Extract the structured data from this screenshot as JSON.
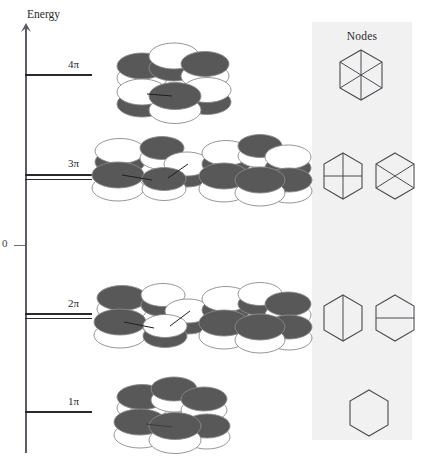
{
  "figure": {
    "axis": {
      "label": "Energy",
      "zero_label": "0",
      "arrow": "up-arrow"
    },
    "energy_levels": [
      {
        "id": "4pi",
        "label": "4π",
        "y": 74,
        "degeneracy": 1,
        "label_x": 68
      },
      {
        "id": "3pi",
        "label": "3π",
        "y": 176,
        "degeneracy": 2,
        "label_x": 68
      },
      {
        "id": "2pi",
        "label": "2π",
        "y": 315,
        "degeneracy": 2,
        "label_x": 68
      },
      {
        "id": "1pi",
        "label": "1π",
        "y": 411,
        "degeneracy": 1,
        "label_x": 68
      }
    ],
    "nodes_panel": {
      "title": "Nodes",
      "background_color": "#f1f1f1",
      "rows": [
        {
          "level": "4pi",
          "glyphs": [
            {
              "name": "hexagon-three-diameters",
              "lines": [
                "vertical",
                "diag-left",
                "diag-right"
              ]
            }
          ]
        },
        {
          "level": "3pi",
          "glyphs": [
            {
              "name": "hexagon-vertical-horizontal-cross",
              "lines": [
                "vertical",
                "horizontal"
              ]
            },
            {
              "name": "hexagon-x-cross",
              "lines": [
                "diag-left",
                "diag-right"
              ]
            }
          ]
        },
        {
          "level": "2pi",
          "glyphs": [
            {
              "name": "hexagon-vertical-node",
              "lines": [
                "vertical"
              ]
            },
            {
              "name": "hexagon-horizontal-node",
              "lines": [
                "horizontal"
              ]
            }
          ]
        },
        {
          "level": "1pi",
          "glyphs": [
            {
              "name": "hexagon-no-node",
              "lines": []
            }
          ]
        }
      ]
    },
    "orbital_diagrams": [
      {
        "id": "orbital-4pi",
        "level": "4pi",
        "caption": "",
        "top_lobe_phases": [
          "dark",
          "light",
          "dark",
          "light",
          "dark",
          "light"
        ],
        "ring_bonds": false
      },
      {
        "id": "orbital-3pi-a",
        "level": "3pi",
        "caption": "",
        "top_lobe_phases": [
          "light",
          "dark",
          "light",
          "light",
          "dark",
          "dark"
        ],
        "ring_bonds": true
      },
      {
        "id": "orbital-3pi-b",
        "level": "3pi",
        "caption": "",
        "top_lobe_phases": [
          "light",
          "dark",
          "dark",
          "dark",
          "light",
          "light"
        ],
        "ring_bonds": false
      },
      {
        "id": "orbital-2pi-a",
        "level": "2pi",
        "caption": "",
        "top_lobe_phases": [
          "dark",
          "light",
          "light",
          "light",
          "dark",
          "dark"
        ],
        "ring_bonds": true
      },
      {
        "id": "orbital-2pi-b",
        "level": "2pi",
        "caption": "",
        "top_lobe_phases": [
          "light",
          "dark",
          "dark",
          "dark",
          "light",
          "dark"
        ],
        "ring_bonds": false
      },
      {
        "id": "orbital-1pi",
        "level": "1pi",
        "caption": "",
        "top_lobe_phases": [
          "dark",
          "dark",
          "dark",
          "dark",
          "dark",
          "dark"
        ],
        "ring_bonds": false
      }
    ],
    "colors": {
      "dark_lobe": "#585858",
      "light_lobe": "#ffffff",
      "lobe_outline": "#8a8a8a",
      "level_line": "#2a2a2a",
      "axis": "#5b5b6a",
      "panel": "#f1f1f1",
      "text": "#1f1f1f"
    }
  }
}
